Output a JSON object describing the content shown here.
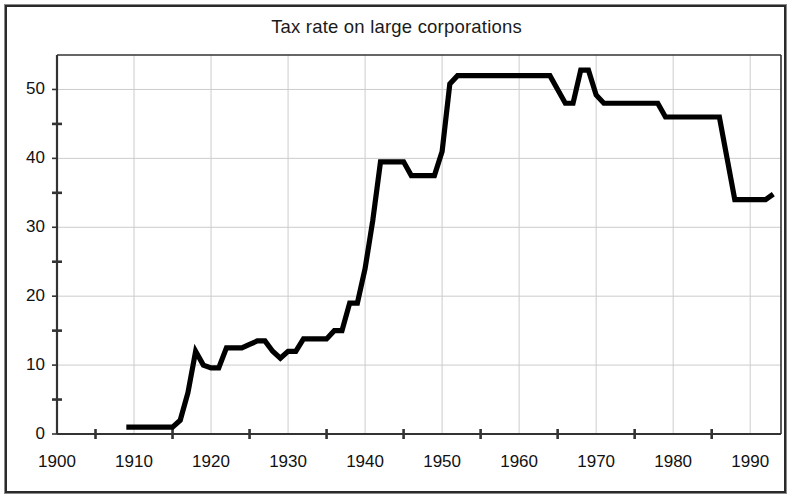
{
  "document": {
    "frame_color": "#2a2a2a",
    "background": "#ffffff"
  },
  "chart_data": {
    "type": "line",
    "title": "Tax rate on large corporations",
    "xlabel": "",
    "ylabel": "",
    "xlim": [
      1900,
      1994
    ],
    "ylim": [
      0,
      55
    ],
    "grid": true,
    "legend": null,
    "line_color": "#000000",
    "grid_color": "#cccccc",
    "axis_color": "#333333",
    "y_major_ticks": [
      0,
      10,
      20,
      30,
      40,
      50
    ],
    "y_minor_ticks": [
      5,
      15,
      25,
      35,
      45
    ],
    "y_tick_labels": [
      "0",
      "10",
      "20",
      "30",
      "40",
      "50"
    ],
    "x_major_ticks": [
      1900,
      1910,
      1920,
      1930,
      1940,
      1950,
      1960,
      1970,
      1980,
      1990
    ],
    "x_minor_ticks": [
      1905,
      1915,
      1925,
      1935,
      1945,
      1955,
      1965,
      1975,
      1985
    ],
    "x_tick_labels": [
      "1900",
      "1910",
      "1920",
      "1930",
      "1940",
      "1950",
      "1960",
      "1970",
      "1980",
      "1990"
    ],
    "x": [
      1909,
      1910,
      1911,
      1912,
      1913,
      1914,
      1915,
      1916,
      1917,
      1918,
      1919,
      1920,
      1921,
      1922,
      1923,
      1924,
      1925,
      1926,
      1927,
      1928,
      1929,
      1930,
      1931,
      1932,
      1933,
      1934,
      1935,
      1936,
      1937,
      1938,
      1939,
      1940,
      1941,
      1942,
      1943,
      1944,
      1945,
      1946,
      1947,
      1948,
      1949,
      1950,
      1951,
      1952,
      1953,
      1954,
      1955,
      1956,
      1957,
      1958,
      1959,
      1960,
      1961,
      1962,
      1963,
      1964,
      1965,
      1966,
      1967,
      1968,
      1969,
      1970,
      1971,
      1972,
      1973,
      1974,
      1975,
      1976,
      1977,
      1978,
      1979,
      1980,
      1981,
      1982,
      1983,
      1984,
      1985,
      1986,
      1987,
      1988,
      1989,
      1990,
      1991,
      1992,
      1993
    ],
    "y": [
      1.0,
      1.0,
      1.0,
      1.0,
      1.0,
      1.0,
      1.0,
      2.0,
      6.0,
      12.0,
      10.0,
      9.6,
      9.6,
      12.5,
      12.5,
      12.5,
      13.0,
      13.5,
      13.5,
      12.0,
      11.0,
      12.0,
      12.0,
      13.8,
      13.8,
      13.8,
      13.8,
      15.0,
      15.0,
      19.0,
      19.0,
      24.0,
      31.0,
      39.5,
      39.5,
      39.5,
      39.5,
      37.5,
      37.5,
      37.5,
      37.5,
      41.0,
      50.8,
      52.0,
      52.0,
      52.0,
      52.0,
      52.0,
      52.0,
      52.0,
      52.0,
      52.0,
      52.0,
      52.0,
      52.0,
      52.0,
      50.0,
      48.0,
      48.0,
      52.8,
      52.8,
      49.2,
      48.0,
      48.0,
      48.0,
      48.0,
      48.0,
      48.0,
      48.0,
      48.0,
      46.0,
      46.0,
      46.0,
      46.0,
      46.0,
      46.0,
      46.0,
      46.0,
      40.0,
      34.0,
      34.0,
      34.0,
      34.0,
      34.0,
      34.8
    ],
    "annotations": [
      {
        "label": "flat near 1% from 1909 to 1915",
        "x": 1912,
        "y": 1.0
      },
      {
        "label": "wartime peak plateau 52% 1952-1963",
        "x": 1957,
        "y": 52.0
      },
      {
        "label": "surcharge spike 52.8% 1968-1969",
        "x": 1968,
        "y": 52.8
      },
      {
        "label": "1986 Tax Reform drop to 34%",
        "x": 1988,
        "y": 34.0
      }
    ]
  }
}
